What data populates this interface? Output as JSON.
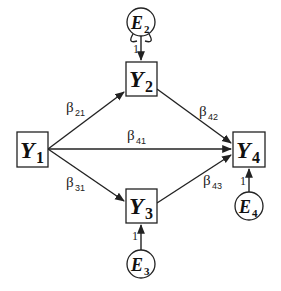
{
  "diagram": {
    "type": "path-diagram",
    "nodes": [
      {
        "id": "Y1",
        "kind": "observed",
        "letter": "Y",
        "sub": "1"
      },
      {
        "id": "Y2",
        "kind": "observed",
        "letter": "Y",
        "sub": "2"
      },
      {
        "id": "Y3",
        "kind": "observed",
        "letter": "Y",
        "sub": "3"
      },
      {
        "id": "Y4",
        "kind": "observed",
        "letter": "Y",
        "sub": "4"
      },
      {
        "id": "E2",
        "kind": "error",
        "letter": "E",
        "sub": "2"
      },
      {
        "id": "E3",
        "kind": "error",
        "letter": "E",
        "sub": "3"
      },
      {
        "id": "E4",
        "kind": "error",
        "letter": "E",
        "sub": "4"
      }
    ],
    "edges": [
      {
        "from": "Y1",
        "to": "Y2",
        "label": "β",
        "sub": "21"
      },
      {
        "from": "Y1",
        "to": "Y4",
        "label": "β",
        "sub": "41"
      },
      {
        "from": "Y1",
        "to": "Y3",
        "label": "β",
        "sub": "31"
      },
      {
        "from": "Y2",
        "to": "Y4",
        "label": "β",
        "sub": "42"
      },
      {
        "from": "Y3",
        "to": "Y4",
        "label": "β",
        "sub": "43"
      },
      {
        "from": "E2",
        "to": "Y2",
        "label": "1",
        "sub": ""
      },
      {
        "from": "E3",
        "to": "Y3",
        "label": "1",
        "sub": ""
      },
      {
        "from": "E4",
        "to": "Y4",
        "label": "1",
        "sub": ""
      }
    ],
    "self_loops": [
      "E2"
    ]
  },
  "labels": {
    "y1": {
      "letter": "Y",
      "sub": "1"
    },
    "y2": {
      "letter": "Y",
      "sub": "2"
    },
    "y3": {
      "letter": "Y",
      "sub": "3"
    },
    "y4": {
      "letter": "Y",
      "sub": "4"
    },
    "e2": {
      "letter": "E",
      "sub": "2"
    },
    "e3": {
      "letter": "E",
      "sub": "3"
    },
    "e4": {
      "letter": "E",
      "sub": "4"
    },
    "b21": {
      "sym": "β",
      "sub": "21"
    },
    "b41": {
      "sym": "β",
      "sub": "41"
    },
    "b31": {
      "sym": "β",
      "sub": "31"
    },
    "b42": {
      "sym": "β",
      "sub": "42"
    },
    "b43": {
      "sym": "β",
      "sub": "43"
    },
    "w_e2": "1",
    "w_e3": "1",
    "w_e4": "1"
  }
}
